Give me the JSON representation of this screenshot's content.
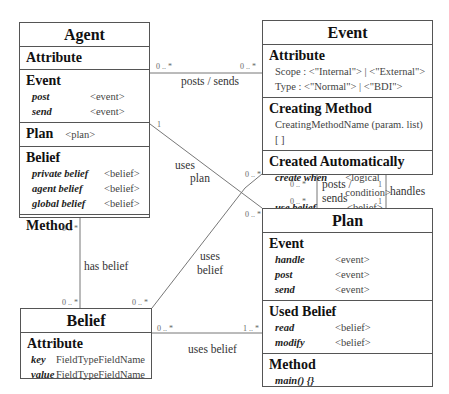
{
  "agent": {
    "title": "Agent",
    "attribute_head": "Attribute",
    "event_head": "Event",
    "events": [
      {
        "key": "post",
        "value": "<event>"
      },
      {
        "key": "send",
        "value": "<event>"
      }
    ],
    "plan_head": "Plan",
    "plan_value": "<plan>",
    "belief_head": "Belief",
    "beliefs": [
      {
        "key": "private belief",
        "value": "<belief>"
      },
      {
        "key": "agent belief",
        "value": "<belief>"
      },
      {
        "key": "global belief",
        "value": "<belief>"
      }
    ],
    "method_head": "Method"
  },
  "event": {
    "title": "Event",
    "attribute_head": "Attribute",
    "attributes": [
      "Scope : <\"Internal\"> | <\"External\">",
      "Type : <\"Normal\"> | <\"BDI\">"
    ],
    "creating_head": "Creating Method",
    "creating_value": "CreatingMethodName (param. list) [ ]",
    "auto_head": "Created Automatically",
    "auto_rows": [
      {
        "key": "create when",
        "value": "<logical condition>"
      },
      {
        "key": "use belief",
        "value": "<belief>"
      }
    ]
  },
  "plan": {
    "title": "Plan",
    "event_head": "Event",
    "events": [
      {
        "key": "handle",
        "value": "<event>"
      },
      {
        "key": "post",
        "value": "<event>"
      },
      {
        "key": "send",
        "value": "<event>"
      }
    ],
    "used_belief_head": "Used Belief",
    "used_beliefs": [
      {
        "key": "read",
        "value": "<belief>"
      },
      {
        "key": "modify",
        "value": "<belief>"
      }
    ],
    "method_head": "Method",
    "method_value": "main() {}"
  },
  "belief": {
    "title": "Belief",
    "attribute_head": "Attribute",
    "rows": [
      {
        "key": "key",
        "type": "FieldType",
        "name": "FieldName"
      },
      {
        "key": "value",
        "type": "FieldType",
        "name": "FieldName"
      }
    ]
  },
  "relations": {
    "agent_event": {
      "label": "posts / sends",
      "left_mult": "0 .. *",
      "right_mult": "0 .. *"
    },
    "agent_plan": {
      "label_1": "uses",
      "label_2": "plan",
      "left_mult": "1",
      "right_mult": "0 .. *"
    },
    "event_plan_posts": {
      "label_1": "posts /",
      "label_2": "sends",
      "mult_top_left": "0 .. *",
      "mult_bottom_left": "0 .. *",
      "mult_top_right": "1",
      "mult_bottom_right": "1"
    },
    "event_plan_handles": {
      "label": "handles"
    },
    "agent_belief": {
      "label": "has belief",
      "top_mult": "0 .. *",
      "bottom_mult": "0 .. *"
    },
    "event_belief": {
      "label_1": "uses",
      "label_2": "belief",
      "top_mult": "0 .. *",
      "bottom_mult": "0 .. *"
    },
    "belief_plan": {
      "label": "uses belief",
      "left_mult": "0 .. *",
      "right_mult": "1 .. *"
    }
  }
}
